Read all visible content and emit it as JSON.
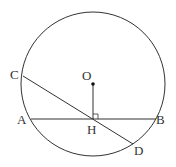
{
  "diagram": {
    "type": "geometry-circle-chords",
    "circle": {
      "center": [
        93,
        84
      ],
      "radius": 72
    },
    "points": {
      "O": {
        "label": "O",
        "x": 93,
        "y": 84
      },
      "A": {
        "label": "A",
        "x": 31,
        "y": 119
      },
      "B": {
        "label": "B",
        "x": 156,
        "y": 119
      },
      "C": {
        "label": "C",
        "x": 23,
        "y": 76
      },
      "D": {
        "label": "D",
        "x": 133,
        "y": 144
      },
      "H": {
        "label": "H",
        "x": 93,
        "y": 119
      }
    },
    "segments": [
      "AB",
      "CD",
      "OH"
    ],
    "right_angle_at": "H",
    "colors": {
      "stroke": "#333333",
      "background": "#ffffff"
    }
  }
}
